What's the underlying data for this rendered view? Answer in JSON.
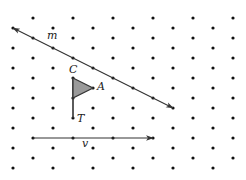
{
  "figure": {
    "width": 246,
    "height": 180,
    "background": "#ffffff",
    "dot_color": "#111111",
    "line_color": "#333333",
    "triangle_fill": "#9a9a9a",
    "triangle_stroke": "#333333"
  },
  "grid": {
    "dot_radius": 1.6,
    "row_start_y": 18,
    "row_step_y": 10,
    "row_count": 16,
    "even_row_x": [
      33,
      73,
      113,
      153,
      193,
      233
    ],
    "odd_row_x": [
      13,
      53,
      93,
      133,
      173,
      213
    ]
  },
  "line_m": {
    "label": "m",
    "from": [
      173,
      108
    ],
    "to": [
      13,
      28
    ],
    "arrows": "both",
    "label_pos": [
      47,
      39
    ]
  },
  "triangle": {
    "vertices": {
      "C": [
        73,
        78
      ],
      "A": [
        93,
        88
      ],
      "B": [
        73,
        98
      ]
    },
    "labels": {
      "C": {
        "text": "C",
        "pos": [
          69,
          73
        ]
      },
      "A": {
        "text": "A",
        "pos": [
          97,
          90
        ]
      }
    }
  },
  "flagpole": {
    "from": [
      73,
      78
    ],
    "to": [
      73,
      118
    ],
    "point_label": "T",
    "label_pos": [
      77,
      122
    ]
  },
  "vector_v": {
    "label": "v",
    "from": [
      33,
      138
    ],
    "to": [
      153,
      138
    ],
    "label_pos": [
      82,
      147
    ]
  }
}
